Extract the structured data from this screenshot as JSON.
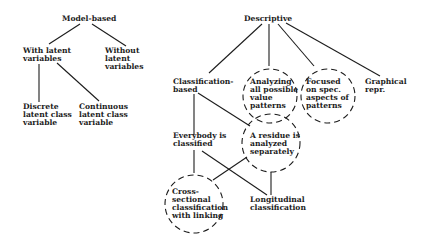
{
  "model_tree": {
    "root": "Model-based",
    "with_latent": [
      "With latent",
      "variables"
    ],
    "without_latent": [
      "Without",
      "latent",
      "variables"
    ],
    "discrete": [
      "Discrete",
      "latent class",
      "variable"
    ],
    "continuous": [
      "Continuous",
      "latent class",
      "variable"
    ]
  },
  "descriptive_tree": {
    "root": "Descriptive",
    "classification": [
      "Classification-",
      "based"
    ],
    "analyzing": [
      "Analyzing",
      "all possible",
      "value",
      "patterns"
    ],
    "focused": [
      "Focused",
      "on spec.",
      "aspects of",
      "patterns"
    ],
    "graphical": [
      "Graphical",
      "repr."
    ],
    "everybody": [
      "Everybody is",
      "classified"
    ],
    "residue": [
      "A residue is",
      "analyzed",
      "separately"
    ],
    "cross": [
      "Cross-",
      "sectional",
      "classification",
      "with linking"
    ],
    "longitudinal": [
      "Longitudinal",
      "classification"
    ]
  },
  "colors": {
    "ink": "#1c1c1c",
    "background": "#ffffff"
  }
}
